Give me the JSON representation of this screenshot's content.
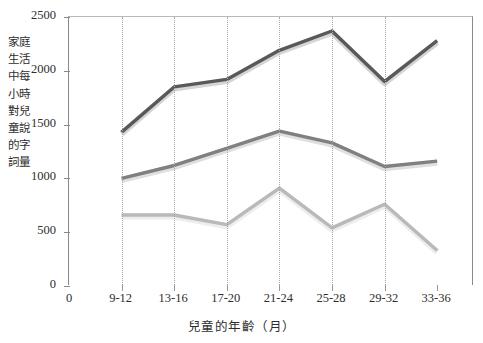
{
  "chart_data": {
    "type": "line",
    "title": "",
    "xlabel": "兒童的年齡（月）",
    "ylabel": "家庭生活中每小時對兒童說的字詞量",
    "categories": [
      "9-12",
      "13-16",
      "17-20",
      "21-24",
      "25-28",
      "29-32",
      "33-36"
    ],
    "origin_tick_label": "0",
    "xlim": [
      0,
      8
    ],
    "ylim": [
      0,
      2500
    ],
    "y_ticks": [
      0,
      500,
      1000,
      1500,
      2000,
      2500
    ],
    "y_tick_labels": [
      "0",
      "500",
      "1000",
      "1500",
      "2000",
      "2500"
    ],
    "grid": "vertical-dotted",
    "legend": "none",
    "series": [
      {
        "name": "professional-families",
        "color": "#595959",
        "values": [
          1430,
          1850,
          1920,
          2190,
          2370,
          1900,
          2280
        ]
      },
      {
        "name": "working-class-families",
        "color": "#808080",
        "values": [
          1000,
          1120,
          1280,
          1440,
          1330,
          1110,
          1160
        ]
      },
      {
        "name": "welfare-families",
        "color": "#b9b9b9",
        "values": [
          660,
          660,
          570,
          910,
          540,
          760,
          330
        ]
      }
    ]
  },
  "axes": {
    "y_title": "家庭生活中每小時對兒童說的字詞量",
    "x_title": "兒童的年齡（月）"
  },
  "style": {
    "background": "#ffffff",
    "axis_color": "#8a8a8a",
    "grid_color": "#a8a8a8",
    "text_color": "#2e2e2e"
  }
}
